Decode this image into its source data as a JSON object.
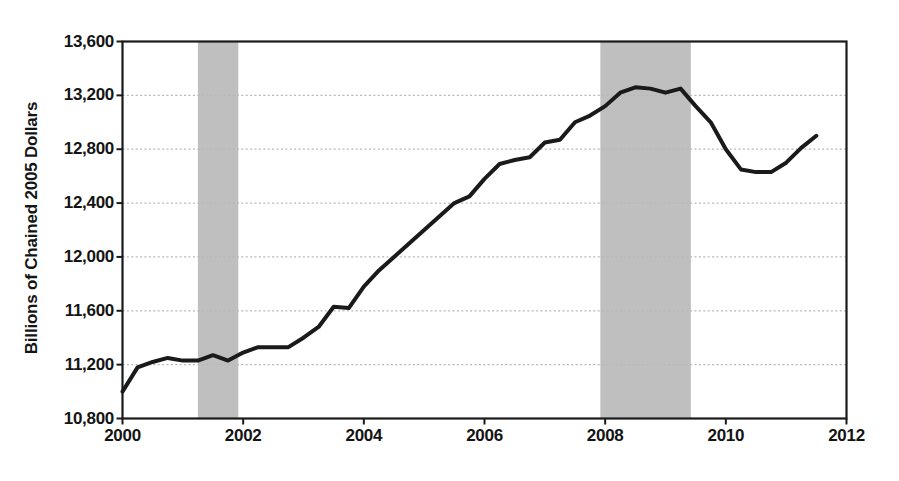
{
  "chart_data": {
    "type": "line",
    "title": "",
    "subtitle": "",
    "xlabel": "",
    "ylabel": "Billions of Chained 2005 Dollars",
    "xlim": [
      2000.0,
      2012.0
    ],
    "ylim": [
      10800,
      13600
    ],
    "xticks": [
      2000,
      2002,
      2004,
      2006,
      2008,
      2010,
      2012
    ],
    "xtick_labels": [
      "2000",
      "2002",
      "2004",
      "2006",
      "2008",
      "2010",
      "2012"
    ],
    "yticks": [
      10800,
      11200,
      11600,
      12000,
      12400,
      12800,
      13200,
      13600
    ],
    "ytick_labels": [
      "10,800",
      "11,200",
      "11,600",
      "12,000",
      "12,400",
      "12,800",
      "13,200",
      "13,600"
    ],
    "grid": true,
    "grid_style": "dotted",
    "grid_color": "#b8b8b8",
    "legend": null,
    "line_color": "#1a1a1a",
    "line_width": 4.0,
    "shaded_band_color": "#bfbfbf",
    "shaded_bands": [
      {
        "label": "recession",
        "x0": 2001.25,
        "x1": 2001.92
      },
      {
        "label": "recession",
        "x0": 2007.92,
        "x1": 2009.42
      }
    ],
    "series": [
      {
        "name": "Real GDP",
        "x": [
          2000.0,
          2000.25,
          2000.5,
          2000.75,
          2001.0,
          2001.25,
          2001.5,
          2001.75,
          2002.0,
          2002.25,
          2002.5,
          2002.75,
          2003.0,
          2003.25,
          2003.5,
          2003.75,
          2004.0,
          2004.25,
          2004.5,
          2004.75,
          2005.0,
          2005.25,
          2005.5,
          2005.75,
          2006.0,
          2006.25,
          2006.5,
          2006.75,
          2007.0,
          2007.25,
          2007.5,
          2007.75,
          2008.0,
          2008.25,
          2008.5,
          2008.75,
          2009.0,
          2009.25,
          2009.5,
          2009.75,
          2010.0,
          2010.25,
          2010.5,
          2010.75,
          2011.0,
          2011.25,
          2011.5
        ],
        "y": [
          11000,
          11180,
          11220,
          11250,
          11230,
          11230,
          11270,
          11230,
          11290,
          11330,
          11330,
          11330,
          11400,
          11480,
          11630,
          11620,
          11780,
          11900,
          12000,
          12100,
          12200,
          12300,
          12400,
          12450,
          12580,
          12690,
          12720,
          12740,
          12850,
          12870,
          13000,
          13050,
          13120,
          13220,
          13260,
          13250,
          13220,
          13250,
          13120,
          13000,
          12800,
          12650,
          12630,
          12630,
          12700,
          12810,
          12900
        ]
      }
    ]
  },
  "axis": {
    "ylabel_text": "Billions of Chained 2005 Dollars"
  },
  "caption": {
    "text": ""
  }
}
